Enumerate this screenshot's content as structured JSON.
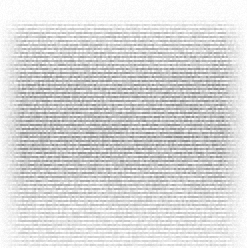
{
  "image": {
    "kind": "grayscale-scanline-texture",
    "width": 247,
    "height": 248,
    "alt_text": "Grayscale horizontal scanline texture with noise",
    "background_color": "#ffffff",
    "stripe_dark_color": "#6e6e6e",
    "stripe_light_color": "#f2f2f2",
    "darkest_value": 82,
    "lightest_value": 255
  },
  "texture": {
    "type": "horizontal-stripes",
    "stripe_period_px": 4,
    "stripe_duty_cycle": 0.5,
    "noise_amplitude": 26,
    "noise_cell_px": 2,
    "seed": 20240517,
    "edge_fade_left_px": 22,
    "edge_fade_right_px": 24,
    "edge_fade_top_px": 22,
    "edge_fade_bottom_px": 4
  },
  "envelope": {
    "description": "Vertical brightness envelope controlling stripe contrast per row",
    "y_stops": [
      0,
      18,
      24,
      34,
      52,
      70,
      86,
      104,
      122,
      140,
      158,
      176,
      194,
      210,
      226,
      240,
      248
    ],
    "contrast": [
      0.0,
      0.04,
      0.52,
      0.78,
      0.86,
      0.95,
      1.0,
      0.97,
      0.99,
      1.0,
      0.96,
      0.88,
      0.74,
      0.64,
      0.58,
      0.52,
      0.46
    ],
    "base_level": [
      253,
      251,
      238,
      222,
      214,
      206,
      200,
      202,
      200,
      198,
      203,
      210,
      220,
      226,
      230,
      234,
      238
    ]
  },
  "chart_data": {
    "type": "heatmap",
    "title": "",
    "xlabel": "",
    "ylabel": "",
    "colormap": "grayscale",
    "grid": false,
    "legend": "none",
    "xlim": [
      0,
      247
    ],
    "ylim": [
      0,
      248
    ],
    "row_mean_luminance": {
      "y": [
        2,
        10,
        18,
        26,
        34,
        42,
        50,
        58,
        66,
        74,
        82,
        90,
        98,
        106,
        114,
        122,
        130,
        138,
        146,
        154,
        162,
        170,
        178,
        186,
        194,
        202,
        210,
        218,
        226,
        234,
        242,
        247
      ],
      "values": [
        253,
        252,
        251,
        239,
        224,
        217,
        213,
        209,
        206,
        203,
        201,
        200,
        201,
        200,
        199,
        199,
        198,
        198,
        199,
        201,
        203,
        207,
        211,
        216,
        220,
        224,
        227,
        229,
        231,
        234,
        237,
        239
      ]
    },
    "column_mean_luminance": {
      "x": [
        2,
        10,
        18,
        26,
        40,
        60,
        80,
        100,
        120,
        140,
        160,
        180,
        200,
        214,
        224,
        232,
        240,
        246
      ],
      "values": [
        250,
        244,
        228,
        216,
        212,
        211,
        211,
        210,
        211,
        211,
        212,
        211,
        212,
        214,
        222,
        234,
        245,
        252
      ]
    }
  }
}
